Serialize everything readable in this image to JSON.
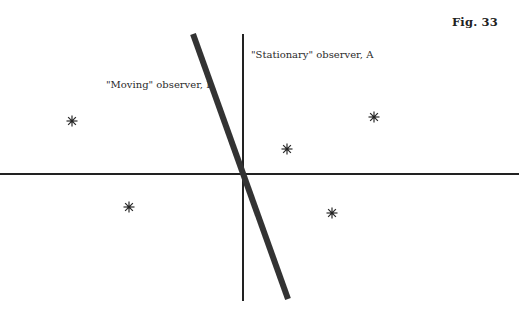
{
  "figure": {
    "label": "Fig. 33"
  },
  "labels": {
    "observer_a": "\"Stationary\" observer, A",
    "observer_b": "\"Moving\" observer, B"
  },
  "colors": {
    "ink": "#222222",
    "background": "#ffffff"
  },
  "axes": {
    "horizontal": {
      "x1": 0,
      "y1": 174,
      "x2": 519,
      "y2": 174,
      "stroke_width": 2
    },
    "observer_a_worldline": {
      "x1": 243,
      "y1": 34,
      "x2": 243,
      "y2": 301,
      "stroke_width": 2
    },
    "observer_b_worldline": {
      "x1": 193,
      "y1": 34,
      "x2": 288,
      "y2": 299,
      "stroke_width": 6
    }
  },
  "events": [
    {
      "id": "event-1",
      "x": 72,
      "y": 121,
      "symbol": "*"
    },
    {
      "id": "event-2",
      "x": 129,
      "y": 207,
      "symbol": "*"
    },
    {
      "id": "event-3",
      "x": 287,
      "y": 149,
      "symbol": "*"
    },
    {
      "id": "event-4",
      "x": 374,
      "y": 117,
      "symbol": "*"
    },
    {
      "id": "event-5",
      "x": 332,
      "y": 213,
      "symbol": "*"
    }
  ]
}
